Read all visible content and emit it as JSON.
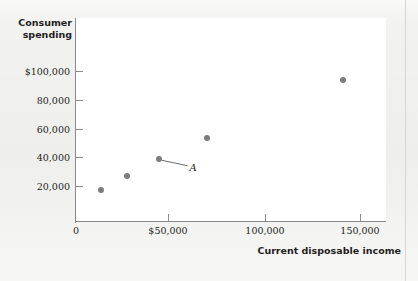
{
  "figure": {
    "background_color": "#f2f2f1",
    "plot_background_color": "#ffffff",
    "axis_color": "#8a8a8a",
    "marker_color": "#7d7d7d"
  },
  "chart_data": {
    "type": "scatter",
    "title": "",
    "xlabel": "Current disposable income",
    "ylabel": "Consumer spending",
    "xlim": [
      0,
      163000
    ],
    "ylim": [
      0,
      113000
    ],
    "grid": false,
    "legend": null,
    "x_ticks": [
      {
        "value": 0,
        "label": "0"
      },
      {
        "value": 50000,
        "label": "$50,000"
      },
      {
        "value": 100000,
        "label": "100,000"
      },
      {
        "value": 150000,
        "label": "150,000"
      }
    ],
    "y_ticks": [
      {
        "value": 20000,
        "label": "20,000"
      },
      {
        "value": 40000,
        "label": "40,000"
      },
      {
        "value": 60000,
        "label": "60,000"
      },
      {
        "value": 80000,
        "label": "80,000"
      },
      {
        "value": 100000,
        "label": "$100,000"
      }
    ],
    "points": [
      {
        "x": 13000,
        "y": 20500
      },
      {
        "x": 27000,
        "y": 30000
      },
      {
        "x": 44000,
        "y": 41500
      },
      {
        "x": 69000,
        "y": 55500
      },
      {
        "x": 141000,
        "y": 94000
      }
    ],
    "annotations": [
      {
        "label": "A",
        "target_x": 44000,
        "target_y": 41500,
        "label_x": 60000,
        "label_y": 35500
      }
    ]
  }
}
